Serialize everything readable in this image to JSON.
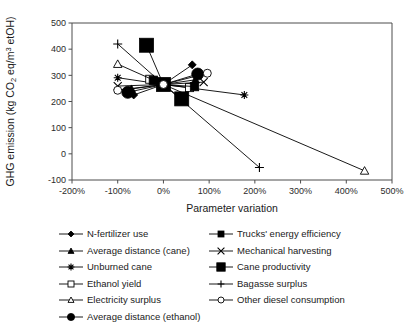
{
  "chart_data": {
    "type": "scatter",
    "title": "",
    "xlabel": "Parameter variation",
    "ylabel": "GHG emission (kg CO2 eq/m3 etOH)",
    "xlim": [
      -200,
      500
    ],
    "ylim": [
      -100,
      500
    ],
    "xticks": [
      "-200%",
      "-100%",
      "0%",
      "100%",
      "200%",
      "300%",
      "400%",
      "500%"
    ],
    "xtick_values": [
      -200,
      -100,
      0,
      100,
      200,
      300,
      400,
      500
    ],
    "yticks": [
      "-100",
      "0",
      "100",
      "200",
      "300",
      "400",
      "500"
    ],
    "ytick_values": [
      -100,
      0,
      100,
      200,
      300,
      400,
      500
    ],
    "grid": false,
    "legend_position": "below",
    "baseline": {
      "x": 0,
      "y": 265
    },
    "series": [
      {
        "name": "N-fertilizer use",
        "marker": "diamond-filled",
        "marker_size": 4,
        "x": [
          -65,
          0,
          63
        ],
        "y": [
          225,
          265,
          340
        ]
      },
      {
        "name": "Average distance (cane)",
        "marker": "triangle-filled",
        "marker_size": 4,
        "x": [
          -70,
          0,
          70
        ],
        "y": [
          248,
          265,
          283
        ]
      },
      {
        "name": "Unburned cane",
        "marker": "asterisk",
        "marker_size": 4,
        "x": [
          -100,
          0,
          177
        ],
        "y": [
          291,
          265,
          225
        ]
      },
      {
        "name": "Ethanol yield",
        "marker": "square-open",
        "marker_size": 4,
        "x": [
          -30,
          0,
          57
        ],
        "y": [
          285,
          265,
          253
        ]
      },
      {
        "name": "Electricity surplus",
        "marker": "triangle-open",
        "marker_size": 4.2,
        "x": [
          -100,
          0,
          440
        ],
        "y": [
          343,
          265,
          -65
        ]
      },
      {
        "name": "Average distance (ethanol)",
        "marker": "circle-filled",
        "marker_size": 6,
        "x": [
          -78,
          0,
          75
        ],
        "y": [
          235,
          265,
          305
        ]
      },
      {
        "name": "Trucks' energy efficiency",
        "marker": "square-filled",
        "marker_size": 4.2,
        "x": [
          -22,
          0,
          68
        ],
        "y": [
          281,
          265,
          257
        ]
      },
      {
        "name": "Mechanical harvesting",
        "marker": "x-mark",
        "marker_size": 4,
        "x": [
          -100,
          0,
          88
        ],
        "y": [
          259,
          265,
          274
        ]
      },
      {
        "name": "Cane productivity",
        "marker": "square-large-filled",
        "marker_size": 7,
        "x": [
          -37,
          0,
          40
        ],
        "y": [
          415,
          265,
          210
        ]
      },
      {
        "name": "Bagasse surplus",
        "marker": "plus",
        "marker_size": 4.5,
        "x": [
          -100,
          0,
          210
        ],
        "y": [
          420,
          265,
          -52
        ]
      },
      {
        "name": "Other diesel consumption",
        "marker": "circle-open",
        "marker_size": 4,
        "x": [
          -100,
          0,
          96
        ],
        "y": [
          243,
          265,
          308
        ]
      }
    ]
  },
  "legend": {
    "left_column": [
      {
        "label": "N-fertilizer use",
        "marker": "diamond-filled"
      },
      {
        "label": "Average distance (cane)",
        "marker": "triangle-filled"
      },
      {
        "label": "Unburned cane",
        "marker": "asterisk"
      },
      {
        "label": "Ethanol yield",
        "marker": "square-open"
      },
      {
        "label": "Electricity surplus",
        "marker": "triangle-open"
      },
      {
        "label": "Average distance (ethanol)",
        "marker": "circle-filled"
      }
    ],
    "right_column": [
      {
        "label": "Trucks' energy efficiency",
        "marker": "square-filled"
      },
      {
        "label": "Mechanical harvesting",
        "marker": "x-mark"
      },
      {
        "label": "Cane productivity",
        "marker": "square-large-filled"
      },
      {
        "label": "Bagasse surplus",
        "marker": "plus"
      },
      {
        "label": "Other diesel consumption",
        "marker": "circle-open"
      }
    ]
  },
  "colors": {
    "marker": "#000000",
    "line": "#000000",
    "axis": "#4d4d4d",
    "text": "#1a1a1a",
    "background": "#ffffff"
  }
}
